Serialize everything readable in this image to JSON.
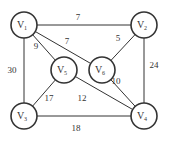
{
  "nodes": [
    {
      "id": "v1",
      "label": "V",
      "sub": "1",
      "x": 24,
      "y": 25
    },
    {
      "id": "v2",
      "label": "V",
      "sub": "2",
      "x": 144,
      "y": 25
    },
    {
      "id": "v5",
      "label": "V",
      "sub": "5",
      "x": 64,
      "y": 70
    },
    {
      "id": "v6",
      "label": "V",
      "sub": "6",
      "x": 102,
      "y": 70
    },
    {
      "id": "v3",
      "label": "V",
      "sub": "3",
      "x": 24,
      "y": 116
    },
    {
      "id": "v4",
      "label": "V",
      "sub": "4",
      "x": 144,
      "y": 116
    }
  ],
  "edges": [
    {
      "from": "v1",
      "to": "v2",
      "weight": "7",
      "lx": 78,
      "ly": 20
    },
    {
      "from": "v1",
      "to": "v6",
      "weight": "7",
      "lx": 67,
      "ly": 44
    },
    {
      "from": "v1",
      "to": "v5",
      "weight": "9",
      "lx": 36,
      "ly": 49
    },
    {
      "from": "v1",
      "to": "v3",
      "weight": "30",
      "lx": 12,
      "ly": 73
    },
    {
      "from": "v2",
      "to": "v6",
      "weight": "5",
      "lx": 118,
      "ly": 41
    },
    {
      "from": "v2",
      "to": "v4",
      "weight": "24",
      "lx": 154,
      "ly": 68
    },
    {
      "from": "v6",
      "to": "v4",
      "weight": "10",
      "lx": 116,
      "ly": 84
    },
    {
      "from": "v5",
      "to": "v4",
      "weight": "12",
      "lx": 82,
      "ly": 101
    },
    {
      "from": "v5",
      "to": "v3",
      "weight": "17",
      "lx": 49,
      "ly": 101
    },
    {
      "from": "v3",
      "to": "v4",
      "weight": "18",
      "lx": 76,
      "ly": 131
    }
  ],
  "style": {
    "stroke": "#333333",
    "radius": 13
  }
}
